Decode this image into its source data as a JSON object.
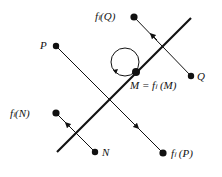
{
  "diagram": {
    "colors": {
      "ink": "#111111",
      "background": "#ffffff"
    },
    "mirror_line": {
      "from": [
        57,
        152
      ],
      "to": [
        191,
        18
      ]
    },
    "points": [
      {
        "id": "P",
        "label": "P",
        "pos": [
          56,
          46
        ]
      },
      {
        "id": "fP",
        "label": "fₗ(P)",
        "pos": [
          163,
          153
        ]
      },
      {
        "id": "Q",
        "label": "Q",
        "pos": [
          191,
          76
        ]
      },
      {
        "id": "fQ",
        "label": "fₗ(Q)",
        "pos": [
          134,
          17
        ]
      },
      {
        "id": "N",
        "label": "N",
        "pos": [
          95,
          152
        ]
      },
      {
        "id": "fN",
        "label": "fₗ(N)",
        "pos": [
          56,
          113
        ]
      },
      {
        "id": "M",
        "label": "M = fₗ(M)",
        "pos": [
          136,
          72
        ]
      }
    ],
    "labels": {
      "P": "P",
      "fP": "fₗ (P)",
      "Q": "Q",
      "fQ": "fₗ(Q)",
      "N": "N",
      "fN": "fₗ(N)",
      "M": "M = fₗ (M)"
    },
    "mappings": [
      {
        "from": "P",
        "to": "fP"
      },
      {
        "from": "Q",
        "to": "fQ"
      },
      {
        "from": "N",
        "to": "fN"
      },
      {
        "from": "M",
        "to": "M",
        "type": "fixed-point-loop"
      }
    ]
  }
}
